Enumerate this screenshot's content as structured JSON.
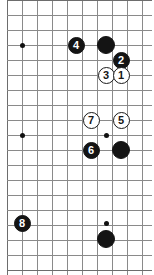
{
  "diagram": {
    "kind": "go-board-diagram",
    "width": 154,
    "height": 275,
    "colors": {
      "background": "#ffffff",
      "grid": "#8a8a8a",
      "grid_edge": "#6d6d6d",
      "black_stone": "#141414",
      "white_stone": "#ffffff",
      "white_stone_border": "#1a1a1a",
      "black_label": "#ffffff",
      "white_label": "#161616",
      "star_point": "#111111"
    },
    "grid": {
      "spacing": 15,
      "vertical_lines_x": [
        7,
        22,
        37,
        52,
        67,
        82,
        97,
        106,
        121,
        136,
        151
      ],
      "horizontal_lines_y": [
        0,
        15,
        30,
        45,
        60,
        75,
        90,
        105,
        120,
        135,
        150,
        165,
        180,
        195,
        210,
        223,
        240,
        255,
        270
      ],
      "columns": 11,
      "rows": 19
    },
    "star_points": [
      {
        "name": "star-point-upper-left",
        "x": 22,
        "y": 45
      },
      {
        "name": "star-point-middle-left",
        "x": 22,
        "y": 135
      },
      {
        "name": "star-point-middle-right",
        "x": 106,
        "y": 135
      },
      {
        "name": "star-point-lower-right",
        "x": 106,
        "y": 223
      }
    ],
    "stones": [
      {
        "name": "stone-black-unnumbered-top",
        "color": "black",
        "label": "",
        "x": 106,
        "y": 45,
        "size": 18
      },
      {
        "name": "stone-black-4",
        "color": "black",
        "label": "4",
        "x": 76,
        "y": 45,
        "size": 17
      },
      {
        "name": "stone-black-2",
        "color": "black",
        "label": "2",
        "x": 121,
        "y": 60,
        "size": 17
      },
      {
        "name": "stone-white-3",
        "color": "white",
        "label": "3",
        "x": 106,
        "y": 75,
        "size": 17
      },
      {
        "name": "stone-white-1",
        "color": "white",
        "label": "1",
        "x": 121,
        "y": 75,
        "size": 17
      },
      {
        "name": "stone-white-7",
        "color": "white",
        "label": "7",
        "x": 91,
        "y": 120,
        "size": 17
      },
      {
        "name": "stone-white-5",
        "color": "white",
        "label": "5",
        "x": 121,
        "y": 120,
        "size": 17
      },
      {
        "name": "stone-black-6",
        "color": "black",
        "label": "6",
        "x": 91,
        "y": 150,
        "size": 17
      },
      {
        "name": "stone-black-unnumbered-middle",
        "color": "black",
        "label": "",
        "x": 121,
        "y": 150,
        "size": 18
      },
      {
        "name": "stone-black-8",
        "color": "black",
        "label": "8",
        "x": 22,
        "y": 223,
        "size": 17
      },
      {
        "name": "stone-black-unnumbered-bottom",
        "color": "black",
        "label": "",
        "x": 106,
        "y": 239,
        "size": 18
      }
    ]
  }
}
